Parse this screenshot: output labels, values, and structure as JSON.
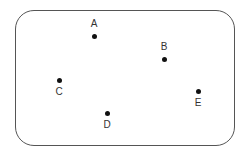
{
  "diagram": {
    "type": "labeled-points",
    "frame": {
      "shape": "rounded-rectangle",
      "border_color": "#555555"
    },
    "points": [
      {
        "id": "A",
        "label": "A",
        "x": 94,
        "y": 36,
        "label_position": "above"
      },
      {
        "id": "B",
        "label": "B",
        "x": 164,
        "y": 59,
        "label_position": "above"
      },
      {
        "id": "C",
        "label": "C",
        "x": 59,
        "y": 80,
        "label_position": "below"
      },
      {
        "id": "D",
        "label": "D",
        "x": 107,
        "y": 113,
        "label_position": "below"
      },
      {
        "id": "E",
        "label": "E",
        "x": 198,
        "y": 91,
        "label_position": "below"
      }
    ]
  }
}
